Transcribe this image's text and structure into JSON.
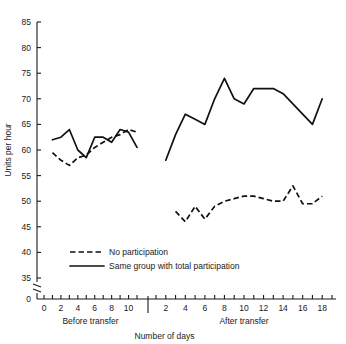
{
  "chart_data": {
    "type": "line",
    "title": "",
    "xlabel": "Number of days",
    "ylabel": "Units per hour",
    "ylim": [
      35,
      85
    ],
    "yticks": [
      35,
      40,
      45,
      50,
      55,
      60,
      65,
      70,
      75,
      80,
      85
    ],
    "y_axis_break": true,
    "y_origin_label": "0",
    "grid": false,
    "legend_position": "inside-lower-left",
    "panels": [
      {
        "name": "before-transfer",
        "label": "Before transfer",
        "xlim": [
          0,
          11
        ],
        "xticks": [
          0,
          1,
          2,
          3,
          4,
          5,
          6,
          7,
          8,
          9,
          10,
          11
        ],
        "xticklabels": [
          "0",
          "",
          "2",
          "",
          "4",
          "",
          "6",
          "",
          "8",
          "",
          "10",
          ""
        ],
        "series": [
          {
            "name": "Same group with total participation",
            "style": "solid",
            "x": [
              1,
              2,
              3,
              4,
              5,
              6,
              7,
              8,
              9,
              10,
              11
            ],
            "values": [
              62,
              62.5,
              64,
              60,
              58.5,
              62.5,
              62.5,
              61.5,
              64,
              63.5,
              60.5
            ]
          },
          {
            "name": "No participation",
            "style": "dashed",
            "x": [
              1,
              2,
              3,
              4,
              5,
              6,
              7,
              8,
              9,
              10,
              11
            ],
            "values": [
              59.5,
              58,
              57,
              58.5,
              59,
              60.5,
              61.5,
              62.5,
              63,
              64,
              63.5
            ]
          }
        ]
      },
      {
        "name": "after-transfer",
        "label": "After transfer",
        "xlim": [
          1,
          19
        ],
        "xticks": [
          1,
          2,
          3,
          4,
          5,
          6,
          7,
          8,
          9,
          10,
          11,
          12,
          13,
          14,
          15,
          16,
          17,
          18,
          19
        ],
        "xticklabels": [
          "",
          "2",
          "",
          "4",
          "",
          "6",
          "",
          "8",
          "",
          "10",
          "",
          "12",
          "",
          "14",
          "",
          "16",
          "",
          "18",
          ""
        ],
        "series": [
          {
            "name": "Same group with total participation",
            "style": "solid",
            "x": [
              2,
              3,
              4,
              5,
              6,
              7,
              8,
              9,
              10,
              11,
              12,
              13,
              14,
              15,
              16,
              17,
              18
            ],
            "values": [
              58,
              63,
              67,
              66,
              65,
              70,
              74,
              70,
              69,
              72,
              72,
              72,
              71,
              69,
              67,
              65,
              70
            ]
          },
          {
            "name": "No participation",
            "style": "dashed",
            "x": [
              3,
              4,
              5,
              6,
              7,
              8,
              9,
              10,
              11,
              12,
              13,
              14,
              15,
              16,
              17,
              18
            ],
            "values": [
              48,
              46,
              49,
              46.5,
              49,
              50,
              50.5,
              51,
              51,
              50.5,
              50,
              50,
              53,
              49.5,
              49.5,
              51
            ]
          }
        ]
      }
    ],
    "legend": [
      {
        "label": "No participation",
        "style": "dashed"
      },
      {
        "label": "Same group with total participation",
        "style": "solid"
      }
    ]
  }
}
